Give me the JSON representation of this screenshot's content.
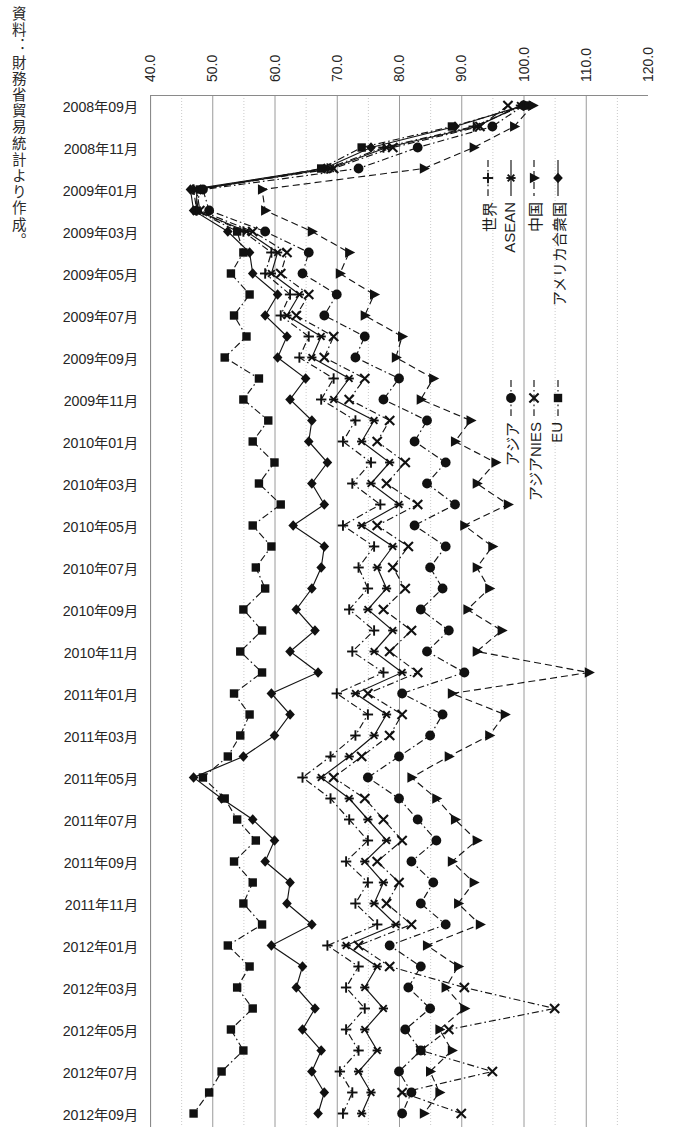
{
  "source_note": "資料：財務省貿易統計より作成。",
  "axis": {
    "tick_labels": [
      "40.0",
      "50.0",
      "60.0",
      "70.0",
      "80.0",
      "90.0",
      "100.0",
      "110.0",
      "120.0"
    ]
  },
  "legend": {
    "items": [
      {
        "label": "アメリカ合衆国",
        "marker": "diamond",
        "line": "solid"
      },
      {
        "label": "EU",
        "marker": "square",
        "line": "dashdot"
      },
      {
        "label": "中国",
        "marker": "triangle",
        "line": "dashed"
      },
      {
        "label": "アジアNIES",
        "marker": "cross",
        "line": "dashdot"
      },
      {
        "label": "ASEAN",
        "marker": "asterisk",
        "line": "solid"
      },
      {
        "label": "アジア",
        "marker": "circle",
        "line": "dashdot"
      },
      {
        "label": "世界",
        "marker": "plus",
        "line": "dashdot"
      }
    ]
  },
  "chart_data": {
    "type": "line",
    "orientation": "horizontal-value-axis",
    "title": "",
    "xlabel": "",
    "ylabel": "",
    "xlim": [
      40.0,
      120.0
    ],
    "grid": true,
    "legend_position": "inside-right",
    "categories": [
      "2008年09月",
      "2008年10月",
      "2008年11月",
      "2008年12月",
      "2009年01月",
      "2009年02月",
      "2009年03月",
      "2009年04月",
      "2009年05月",
      "2009年06月",
      "2009年07月",
      "2009年08月",
      "2009年09月",
      "2009年10月",
      "2009年11月",
      "2009年12月",
      "2010年01月",
      "2010年02月",
      "2010年03月",
      "2010年04月",
      "2010年05月",
      "2010年06月",
      "2010年07月",
      "2010年08月",
      "2010年09月",
      "2010年10月",
      "2010年11月",
      "2010年12月",
      "2011年01月",
      "2011年02月",
      "2011年03月",
      "2011年04月",
      "2011年05月",
      "2011年06月",
      "2011年07月",
      "2011年08月",
      "2011年09月",
      "2011年10月",
      "2011年11月",
      "2011年12月",
      "2012年01月",
      "2012年02月",
      "2012年03月",
      "2012年04月",
      "2012年05月",
      "2012年06月",
      "2012年07月",
      "2012年08月",
      "2012年09月"
    ],
    "tick_labels_every": 2,
    "series": [
      {
        "name": "アメリカ合衆国",
        "marker": "diamond",
        "line": "solid",
        "values": [
          100.0,
          89.0,
          75.5,
          68.0,
          46.5,
          47.0,
          52.5,
          56.0,
          56.5,
          60.5,
          58.5,
          62.0,
          60.5,
          65.0,
          62.5,
          66.0,
          65.5,
          68.5,
          66.0,
          68.0,
          63.0,
          68.0,
          67.5,
          66.0,
          63.5,
          66.5,
          62.5,
          67.0,
          59.5,
          62.5,
          60.0,
          55.0,
          47.0,
          51.5,
          56.5,
          60.0,
          58.5,
          62.5,
          62.0,
          66.0,
          59.5,
          64.5,
          63.5,
          66.5,
          64.5,
          67.5,
          66.0,
          68.0,
          67.0
        ]
      },
      {
        "name": "EU",
        "marker": "square",
        "line": "dashdot",
        "values": [
          100.5,
          88.5,
          74.0,
          67.5,
          48.0,
          47.5,
          54.0,
          55.0,
          53.0,
          56.0,
          53.5,
          55.5,
          52.0,
          57.5,
          55.0,
          59.0,
          56.5,
          60.0,
          57.5,
          61.0,
          56.5,
          59.5,
          57.0,
          58.5,
          55.0,
          58.0,
          54.5,
          58.0,
          53.5,
          56.0,
          54.5,
          52.5,
          48.5,
          52.0,
          54.0,
          57.0,
          53.5,
          56.5,
          55.0,
          58.0,
          52.5,
          56.0,
          54.0,
          56.5,
          53.0,
          55.0,
          51.5,
          49.5,
          47.0
        ]
      },
      {
        "name": "中国",
        "marker": "triangle",
        "line": "dashed",
        "values": [
          101.5,
          98.5,
          92.0,
          84.0,
          58.0,
          58.5,
          66.0,
          72.0,
          70.5,
          76.0,
          74.5,
          80.5,
          79.5,
          85.5,
          83.5,
          91.5,
          89.0,
          95.5,
          92.5,
          97.5,
          90.5,
          95.0,
          92.5,
          94.5,
          91.0,
          96.5,
          92.5,
          110.5,
          88.5,
          97.0,
          94.5,
          88.0,
          82.0,
          86.0,
          89.0,
          92.5,
          88.5,
          92.0,
          89.5,
          93.0,
          84.5,
          89.5,
          87.5,
          90.5,
          86.5,
          88.5,
          85.0,
          86.5,
          84.0
        ]
      },
      {
        "name": "アジアNIES",
        "marker": "cross",
        "line": "dashdot",
        "values": [
          97.5,
          93.0,
          79.0,
          69.5,
          47.5,
          48.0,
          56.5,
          62.0,
          61.0,
          65.5,
          63.5,
          69.5,
          68.0,
          74.5,
          72.0,
          78.5,
          76.5,
          81.0,
          78.0,
          83.0,
          76.5,
          81.5,
          79.0,
          81.0,
          77.5,
          82.0,
          78.5,
          83.0,
          75.0,
          80.5,
          78.5,
          74.0,
          69.5,
          74.5,
          77.5,
          80.5,
          76.5,
          80.0,
          78.0,
          82.0,
          73.5,
          78.5,
          90.5,
          105.0,
          88.0,
          83.5,
          95.0,
          80.5,
          90.0
        ]
      },
      {
        "name": "ASEAN",
        "marker": "asterisk",
        "line": "solid",
        "values": [
          99.5,
          92.5,
          78.0,
          69.0,
          47.5,
          47.5,
          55.5,
          60.5,
          59.5,
          64.0,
          62.0,
          67.5,
          66.0,
          72.0,
          69.5,
          76.0,
          74.0,
          78.5,
          75.5,
          80.0,
          74.0,
          79.0,
          76.5,
          78.0,
          75.0,
          79.0,
          76.0,
          80.5,
          73.0,
          78.0,
          76.0,
          72.0,
          67.5,
          72.0,
          75.0,
          78.0,
          74.5,
          77.5,
          76.0,
          79.5,
          71.5,
          76.5,
          74.5,
          77.5,
          74.5,
          76.5,
          73.5,
          75.5,
          74.0
        ]
      },
      {
        "name": "アジア",
        "marker": "circle",
        "line": "dashdot",
        "values": [
          100.0,
          95.0,
          83.0,
          73.5,
          48.5,
          49.5,
          58.5,
          65.5,
          64.5,
          70.0,
          68.0,
          74.5,
          73.0,
          80.0,
          77.5,
          84.5,
          82.5,
          87.5,
          84.5,
          89.0,
          82.5,
          87.5,
          85.0,
          87.0,
          83.5,
          88.0,
          84.5,
          90.5,
          80.5,
          87.0,
          85.0,
          80.0,
          75.0,
          80.0,
          83.0,
          86.0,
          82.0,
          85.5,
          83.5,
          87.5,
          78.5,
          83.5,
          81.5,
          85.0,
          81.0,
          83.5,
          80.0,
          82.0,
          80.5
        ]
      },
      {
        "name": "世界",
        "marker": "plus",
        "line": "dashdot",
        "values": [
          100.0,
          92.0,
          77.5,
          68.5,
          47.0,
          47.5,
          55.0,
          59.5,
          58.5,
          62.5,
          61.0,
          65.5,
          64.0,
          69.5,
          67.5,
          73.0,
          71.0,
          75.5,
          72.5,
          77.0,
          71.0,
          76.0,
          73.5,
          75.0,
          72.0,
          76.0,
          72.5,
          77.5,
          70.0,
          75.0,
          73.0,
          69.0,
          64.5,
          69.0,
          72.0,
          75.0,
          71.5,
          75.0,
          73.0,
          76.5,
          68.5,
          73.5,
          71.5,
          74.5,
          71.5,
          73.5,
          70.5,
          72.5,
          71.0
        ]
      }
    ]
  }
}
